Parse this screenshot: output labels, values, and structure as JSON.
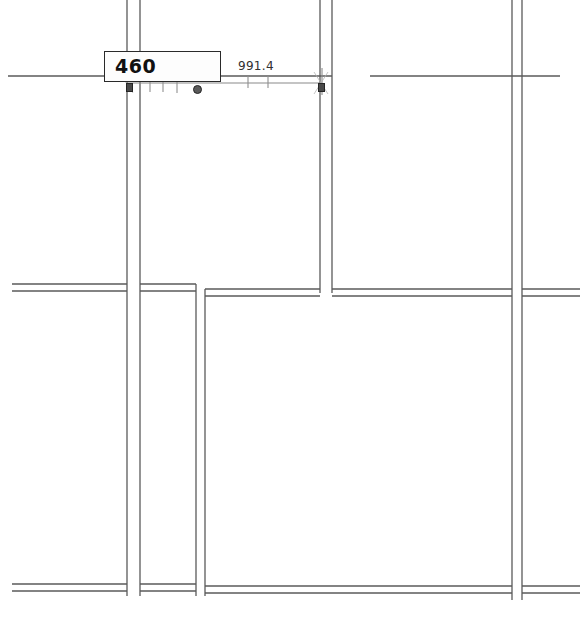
{
  "drawing": {
    "title": "Floor plan dimension edit",
    "background_color": "#ffffff",
    "wall_line_color": "#555555",
    "dimension_line_color": "#7a7a7a"
  },
  "dimension_edit": {
    "value": "460",
    "box_border_color": "#2a2a2a",
    "box_fill_color": "#fdfdfd"
  },
  "dimension_string": {
    "length_label": "991.4",
    "text_color": "#303030"
  },
  "grips": [
    {
      "name": "grip-start-square",
      "shape": "square",
      "x": 126,
      "y": 83
    },
    {
      "name": "grip-mid-circle",
      "shape": "circle",
      "x": 193,
      "y": 85
    },
    {
      "name": "grip-end-square",
      "shape": "square",
      "x": 318,
      "y": 83
    }
  ],
  "geometry": {
    "dimension_line_y": 83,
    "top_wall_y": 76,
    "mid_wall_y": 289,
    "bottom_wall_y": 590,
    "wall_thickness": 12
  }
}
